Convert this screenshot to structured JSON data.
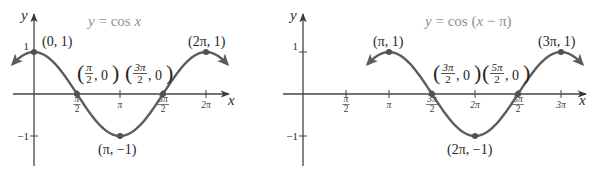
{
  "figure": {
    "background": "#ffffff",
    "curve_color": "#5c5c5c",
    "axis_color": "#454545",
    "point_color": "#505050",
    "title_color": "#8f8f8f"
  },
  "panels": [
    {
      "title_parts": {
        "lhs": "y",
        "mid": " = cos ",
        "arg": "x",
        "tail": ""
      },
      "xlabel": "x",
      "ylabel": "y"
    },
    {
      "title_parts": {
        "lhs": "y",
        "mid": " = cos (",
        "arg": "x",
        "tail": " − π)"
      },
      "xlabel": "x",
      "ylabel": "y"
    }
  ],
  "chart_data": [
    {
      "type": "line",
      "title": "y = cos x",
      "function": "cos(x)",
      "phase_shift": 0,
      "xlabel": "x",
      "ylabel": "y",
      "x_range": [
        -0.785,
        7.069
      ],
      "y_range": [
        -1,
        1
      ],
      "grid": false,
      "x_ticks": [
        {
          "value": 1.5708,
          "label": "π/2"
        },
        {
          "value": 3.1416,
          "label": "π"
        },
        {
          "value": 4.7124,
          "label": "3π/2"
        },
        {
          "value": 6.2832,
          "label": "2π"
        }
      ],
      "y_ticks": [
        {
          "value": 1,
          "label": "1"
        },
        {
          "value": -1,
          "label": "−1"
        }
      ],
      "key_points": [
        {
          "x": 0,
          "y": 1,
          "label": "(0, 1)"
        },
        {
          "x": 1.5708,
          "y": 0,
          "label": "(π/2, 0)"
        },
        {
          "x": 3.1416,
          "y": -1,
          "label": "(π, −1)"
        },
        {
          "x": 4.7124,
          "y": 0,
          "label": "(3π/2, 0)"
        },
        {
          "x": 6.2832,
          "y": 1,
          "label": "(2π, 1)"
        }
      ]
    },
    {
      "type": "line",
      "title": "y = cos (x − π)",
      "function": "cos(x - π)",
      "phase_shift": 3.1416,
      "xlabel": "x",
      "ylabel": "y",
      "x_range": [
        2.356,
        10.21
      ],
      "y_range": [
        -1,
        1
      ],
      "grid": false,
      "x_ticks": [
        {
          "value": 1.5708,
          "label": "π/2"
        },
        {
          "value": 3.1416,
          "label": "π"
        },
        {
          "value": 4.7124,
          "label": "3π/2"
        },
        {
          "value": 6.2832,
          "label": "2π"
        },
        {
          "value": 7.854,
          "label": "5π/2"
        },
        {
          "value": 9.4248,
          "label": "3π"
        }
      ],
      "y_ticks": [
        {
          "value": 1,
          "label": "1"
        },
        {
          "value": -1,
          "label": "−1"
        }
      ],
      "key_points": [
        {
          "x": 3.1416,
          "y": 1,
          "label": "(π, 1)"
        },
        {
          "x": 4.7124,
          "y": 0,
          "label": "(3π/2, 0)"
        },
        {
          "x": 6.2832,
          "y": -1,
          "label": "(2π, −1)"
        },
        {
          "x": 7.854,
          "y": 0,
          "label": "(5π/2, 0)"
        },
        {
          "x": 9.4248,
          "y": 1,
          "label": "(3π, 1)"
        }
      ]
    }
  ]
}
